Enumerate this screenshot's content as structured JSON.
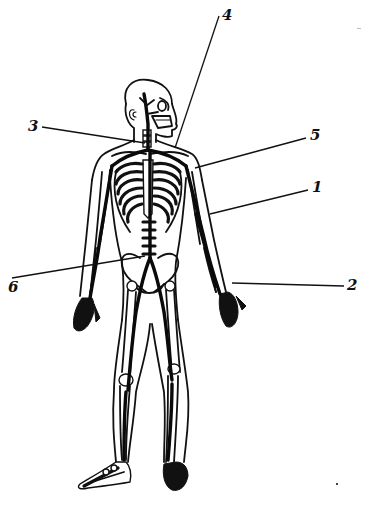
{
  "diagram": {
    "stroke_color": "#111111",
    "background": "#ffffff"
  },
  "callouts": [
    {
      "label": "1",
      "label_x": 312,
      "label_y": 180,
      "line": [
        308,
        190,
        210,
        214
      ]
    },
    {
      "label": "2",
      "label_x": 347,
      "label_y": 278,
      "line": [
        344,
        286,
        232,
        283
      ]
    },
    {
      "label": "3",
      "label_x": 28,
      "label_y": 119,
      "line": [
        42,
        127,
        145,
        143
      ]
    },
    {
      "label": "4",
      "label_x": 222,
      "label_y": 8,
      "line": [
        219,
        16,
        175,
        148
      ]
    },
    {
      "label": "5",
      "label_x": 310,
      "label_y": 128,
      "line": [
        306,
        138,
        195,
        168
      ]
    },
    {
      "label": "6",
      "label_x": 8,
      "label_y": 280,
      "line": [
        12,
        278,
        145,
        256
      ]
    }
  ]
}
